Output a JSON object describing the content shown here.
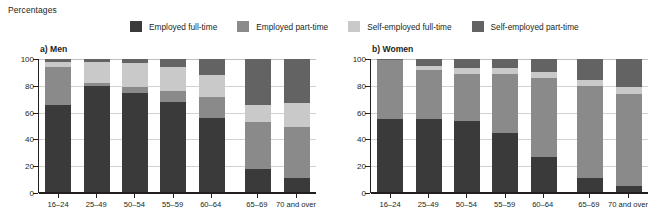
{
  "page_title": "Percentages",
  "legend": {
    "items": [
      {
        "label": "Employed full-time",
        "color": "#3a3a3a",
        "key": "employed_full_time"
      },
      {
        "label": "Employed part-time",
        "color": "#8a8a8a",
        "key": "employed_part_time"
      },
      {
        "label": "Self-employed full-time",
        "color": "#c9c9c9",
        "key": "self_employed_full_time"
      },
      {
        "label": "Self-employed part-time",
        "color": "#636363",
        "key": "self_employed_part_time"
      }
    ]
  },
  "panels": [
    {
      "id": "men",
      "title": "a) Men"
    },
    {
      "id": "women",
      "title": "b) Women"
    }
  ],
  "axis": {
    "y_ticks": [
      "100",
      "80",
      "60",
      "40",
      "20",
      "0"
    ],
    "y_values": [
      100,
      80,
      60,
      40,
      20,
      0
    ]
  },
  "chart_data": [
    {
      "type": "bar",
      "stacked": true,
      "percent": true,
      "title": "a) Men",
      "xlabel": "",
      "ylabel": "Percentages",
      "ylim": [
        0,
        100
      ],
      "yticks": [
        0,
        20,
        40,
        60,
        80,
        100
      ],
      "grid": true,
      "legend_position": "top",
      "categories": [
        "16–24",
        "25–49",
        "50–54",
        "55–59",
        "60–64",
        "65–69",
        "70 and over"
      ],
      "gap_after_index": 4,
      "series": [
        {
          "name": "Employed full-time",
          "color": "#3a3a3a",
          "values": [
            66,
            80,
            75,
            68,
            56,
            18,
            11
          ]
        },
        {
          "name": "Employed part-time",
          "color": "#8a8a8a",
          "values": [
            28,
            2,
            4,
            8,
            16,
            35,
            38
          ]
        },
        {
          "name": "Self-employed full-time",
          "color": "#c9c9c9",
          "values": [
            4,
            16,
            18,
            18,
            16,
            13,
            18
          ]
        },
        {
          "name": "Self-employed part-time",
          "color": "#636363",
          "values": [
            2,
            2,
            3,
            6,
            12,
            34,
            33
          ]
        }
      ]
    },
    {
      "type": "bar",
      "stacked": true,
      "percent": true,
      "title": "b) Women",
      "xlabel": "",
      "ylabel": "Percentages",
      "ylim": [
        0,
        100
      ],
      "yticks": [
        0,
        20,
        40,
        60,
        80,
        100
      ],
      "grid": true,
      "legend_position": "top",
      "categories": [
        "16–24",
        "25–49",
        "50–54",
        "55–59",
        "60–64",
        "65–69",
        "70 and over"
      ],
      "gap_after_index": 4,
      "series": [
        {
          "name": "Employed full-time",
          "color": "#3a3a3a",
          "values": [
            55,
            55,
            54,
            45,
            27,
            11,
            5
          ]
        },
        {
          "name": "Employed part-time",
          "color": "#8a8a8a",
          "values": [
            44,
            37,
            35,
            44,
            59,
            69,
            69
          ]
        },
        {
          "name": "Self-employed full-time",
          "color": "#c9c9c9",
          "values": [
            0,
            3,
            4,
            4,
            4,
            4,
            5
          ]
        },
        {
          "name": "Self-employed part-time",
          "color": "#636363",
          "values": [
            1,
            5,
            7,
            7,
            10,
            16,
            21
          ]
        }
      ]
    }
  ]
}
